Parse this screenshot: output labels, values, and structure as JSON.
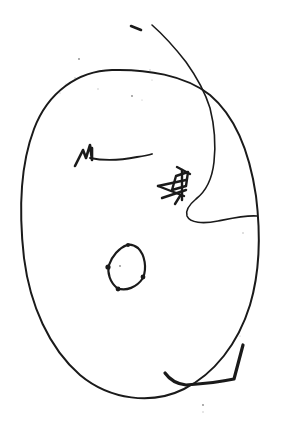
{
  "artwork": {
    "title": "Hand-drawn face sketch",
    "medium": "ink pen on white paper",
    "background_color": "#ffffff",
    "ink_color": "#1a1a1a",
    "canvas": {
      "width": 282,
      "height": 425
    }
  },
  "strokes": {
    "head_outline": {
      "name": "head-outline",
      "description": "large closed oval forming the head",
      "path": "M 112 70 C 78 71 48 92 34 129 C 20 166 19 214 24 258 C 30 305 49 348 80 375 C 110 400 152 405 184 389 C 214 374 238 344 250 305 C 261 268 260 228 256 196 C 250 155 236 117 210 95 C 185 75 146 69 112 70 Z",
      "stroke_width": 2.0
    },
    "contour_line": {
      "name": "contour-line",
      "description": "long stray line entering top-right, crossing the head and wiggling down the right side",
      "path": "M 152 25 C 160 32 172 44 186 62 C 196 76 205 92 210 108 C 214 124 216 144 214 162 C 212 180 205 192 196 199 C 190 204 185 210 187 216 C 190 223 203 224 218 221 C 233 218 246 215 257 216",
      "stroke_width": 1.6
    },
    "jaw_wedge": {
      "name": "jaw-wedge",
      "description": "thick angular wedge crossing the lower-right of the head",
      "path": "M 243 345 C 240 356 237 368 234 379 C 220 382 200 384 186 385 C 177 384 170 380 165 373",
      "stroke_width": 3.2
    },
    "left_eye": {
      "name": "left-eye-mark",
      "description": "M-shaped zigzag eyebrow mark with descending tail",
      "path": "M 75 166 L 83 150 L 86 158 L 90 145 L 92 160 L 92 148",
      "stroke_width": 2.6
    },
    "left_eye_tail": {
      "name": "left-eye-tail",
      "description": "horizontal tapering stroke extending right from left eye mark",
      "path": "M 90 158 C 104 161 122 160 137 157 C 144 156 149 155 152 154",
      "stroke_width": 1.8
    },
    "right_eye": {
      "name": "right-eye-scribble",
      "description": "dense arrow-like scribble cluster forming the right eye",
      "paths": [
        "M 182 170 L 182 200",
        "M 176 176 L 188 172 L 186 186 L 172 190 Z",
        "M 158 186 L 186 180",
        "M 158 186 L 184 196",
        "M 162 198 L 186 190",
        "M 177 167 L 190 174",
        "M 180 196 L 175 204"
      ],
      "stroke_width": 2.4
    },
    "nose": {
      "name": "nose-shape",
      "description": "closed pentagon-like blob forming the nose",
      "path": "M 127 245 C 119 248 112 256 109 265 C 107 273 110 282 117 288 C 126 292 137 287 143 278 C 147 268 145 255 138 248 C 134 245 130 244 127 245 Z",
      "stroke_width": 2.2,
      "corner_dots": [
        {
          "cx": 108,
          "cy": 267,
          "r": 2.6
        },
        {
          "cx": 118,
          "cy": 289,
          "r": 2.4
        },
        {
          "cx": 143,
          "cy": 277,
          "r": 2.4
        },
        {
          "cx": 128,
          "cy": 245,
          "r": 2.0
        }
      ]
    },
    "top_dash": {
      "name": "top-dash",
      "description": "small detached ink dash above the head",
      "path": "M 131 26 L 141 30",
      "stroke_width": 2.6
    }
  },
  "specks": [
    {
      "cx": 79,
      "cy": 59,
      "r": 0.9
    },
    {
      "cx": 98,
      "cy": 89,
      "r": 0.7
    },
    {
      "cx": 132,
      "cy": 96,
      "r": 0.9
    },
    {
      "cx": 142,
      "cy": 100,
      "r": 0.6
    },
    {
      "cx": 66,
      "cy": 84,
      "r": 0.6
    },
    {
      "cx": 150,
      "cy": 70,
      "r": 0.7
    },
    {
      "cx": 152,
      "cy": 80,
      "r": 0.6
    },
    {
      "cx": 75,
      "cy": 78,
      "r": 0.8
    },
    {
      "cx": 243,
      "cy": 233,
      "r": 0.8
    },
    {
      "cx": 120,
      "cy": 266,
      "r": 0.9
    },
    {
      "cx": 203,
      "cy": 405,
      "r": 0.9
    },
    {
      "cx": 203,
      "cy": 412,
      "r": 0.7
    },
    {
      "cx": 240,
      "cy": 336,
      "r": 0.6
    },
    {
      "cx": 60,
      "cy": 93,
      "r": 0.6
    }
  ]
}
